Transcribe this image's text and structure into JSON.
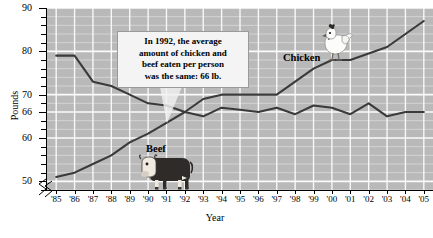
{
  "chart_data": {
    "type": "line",
    "xlabel": "Year",
    "ylabel": "Pounds",
    "ylim": [
      48,
      90
    ],
    "ytick_labels": [
      "90",
      "80",
      "70",
      "66",
      "60",
      "50"
    ],
    "ytick_values": [
      90,
      80,
      70,
      66,
      60,
      50
    ],
    "grid": true,
    "axis_break": true,
    "legend": "inline-labels",
    "categories": [
      "'85",
      "'86",
      "'87",
      "'88",
      "'89",
      "'90",
      "'91",
      "'92",
      "'93",
      "'94",
      "'95",
      "'96",
      "'97",
      "'98",
      "'99",
      "'00",
      "'01",
      "'02",
      "'03",
      "'04",
      "'05"
    ],
    "x_values": [
      1985,
      1986,
      1987,
      1988,
      1989,
      1990,
      1991,
      1992,
      1993,
      1994,
      1995,
      1996,
      1997,
      1998,
      1999,
      2000,
      2001,
      2002,
      2003,
      2004,
      2005
    ],
    "series": [
      {
        "name": "Beef",
        "values": [
          79,
          79,
          73,
          72,
          70,
          68,
          67.5,
          66,
          65,
          67,
          66.5,
          66,
          67,
          65.5,
          67.5,
          67,
          65.5,
          68,
          65,
          66,
          66
        ]
      },
      {
        "name": "Chicken",
        "values": [
          51,
          52,
          54,
          56,
          59,
          61,
          63.5,
          66,
          69,
          70,
          70,
          70,
          70,
          73,
          76,
          78,
          78,
          79.5,
          81,
          84,
          87
        ]
      }
    ],
    "annotations": [
      {
        "name": "crossover-callout",
        "text": "In 1992, the average amount of chicken and beef eaten per person was the same: 66 lb.",
        "points_to_x": "'92",
        "points_to_y": 66
      }
    ]
  },
  "axis": {
    "y_title": "Pounds",
    "x_title": "Year",
    "y_ticks": [
      "90",
      "80",
      "70",
      "66",
      "60",
      "50"
    ],
    "x_ticks": [
      "'85",
      "'86",
      "'87",
      "'88",
      "'89",
      "'90",
      "'91",
      "'92",
      "'93",
      "'94",
      "'95",
      "'96",
      "'97",
      "'98",
      "'99",
      "'00",
      "'01",
      "'02",
      "'03",
      "'04",
      "'05"
    ]
  },
  "callout": {
    "line1": "In 1992, the average",
    "line2": "amount of chicken and",
    "line3": "beef eaten per person",
    "line4": "was the same: 66 lb."
  },
  "series_labels": {
    "beef": "Beef",
    "chicken": "Chicken"
  },
  "title_block": {
    "line1": "UNITED STATES",
    "line2": "Average Annual Per Capita",
    "line3": "Consumption (in lb.)"
  },
  "icons": {
    "cow": "cow-icon",
    "chicken": "chicken-icon"
  },
  "colors": {
    "plot_background": "#b9b9b9",
    "gridline": "#ffffff",
    "series_line": "#3a3a3a",
    "callout_background": "#f4f4f4",
    "text": "#000000"
  }
}
